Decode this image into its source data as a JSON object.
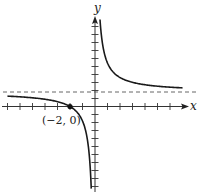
{
  "chart_data": {
    "type": "line",
    "title": "",
    "xlabel": "x",
    "ylabel": "y",
    "function_form": "y = 1 + 2/x",
    "asymptotes": {
      "vertical": 0,
      "horizontal": 1
    },
    "xlim": [
      -7,
      7
    ],
    "ylim": [
      -6,
      6
    ],
    "x_ticks": [
      -7,
      -6,
      -5,
      -4,
      -3,
      -2,
      -1,
      1,
      2,
      3,
      4,
      5,
      6
    ],
    "grid": false,
    "annotations": [
      {
        "label": "(−2, 0)",
        "x": -2,
        "y": 0,
        "marker": "filled-dot"
      }
    ],
    "series": [
      {
        "name": "left branch",
        "x": [
          -7,
          -6,
          -5,
          -4,
          -3,
          -2.5,
          -2,
          -1.5,
          -1.2,
          -1,
          -0.8,
          -0.6,
          -0.5,
          -0.4,
          -0.35,
          -0.3
        ],
        "y": [
          0.714,
          0.667,
          0.6,
          0.5,
          0.333,
          0.2,
          0,
          -0.333,
          -0.667,
          -1,
          -1.5,
          -2.333,
          -3,
          -4,
          -4.714,
          -5.667
        ]
      },
      {
        "name": "right branch",
        "x": [
          0.4,
          0.5,
          0.6,
          0.8,
          1,
          1.3,
          1.6,
          2,
          2.5,
          3,
          4,
          5,
          6,
          7
        ],
        "y": [
          6,
          5,
          4.333,
          3.5,
          3,
          2.538,
          2.25,
          2,
          1.8,
          1.667,
          1.5,
          1.4,
          1.333,
          1.286
        ]
      }
    ]
  },
  "labels": {
    "x_axis": "x",
    "y_axis": "y",
    "point": "(−2, 0)"
  }
}
